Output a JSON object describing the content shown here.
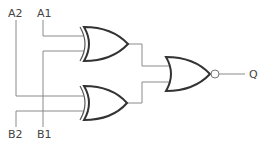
{
  "diagram": {
    "type": "logic-circuit",
    "labels": {
      "a2": "A2",
      "a1": "A1",
      "b2": "B2",
      "b1": "B1",
      "output": "Q"
    },
    "gates": [
      {
        "id": "xor-top",
        "type": "XOR",
        "inputs": [
          "A1",
          "B1"
        ]
      },
      {
        "id": "xor-bottom",
        "type": "XOR",
        "inputs": [
          "A2",
          "B2"
        ]
      },
      {
        "id": "nor-out",
        "type": "NOR",
        "inputs": [
          "xor-top",
          "xor-bottom"
        ],
        "output": "Q"
      }
    ],
    "colors": {
      "wire": "#8a8a8a",
      "gate_outline": "#333333",
      "label": "#444444"
    }
  }
}
